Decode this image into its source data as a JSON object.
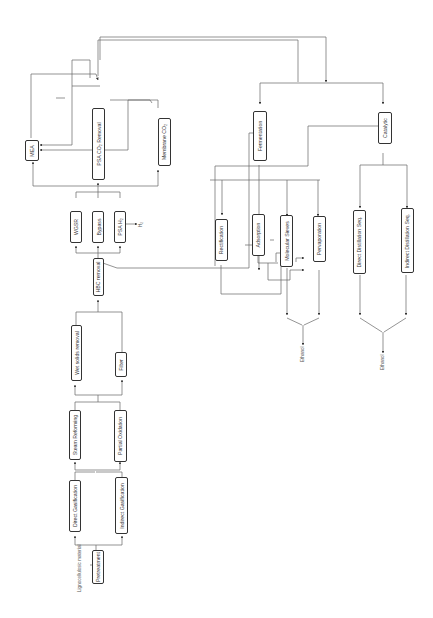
{
  "diagram": {
    "title": "",
    "orientation": "rotated-90-ccw",
    "input_label": "Lignocellulosic material",
    "nodes": {
      "pretreatment": "Pretreatment",
      "direct_gasification": "Direct Gasification",
      "indirect_gasification": "Indirect Gasification",
      "steam_reforming": "Steam Reforming",
      "partial_oxidation": "Partial Oxidation",
      "wet_solids_removal": "Wet solids removal",
      "filter": "Filter",
      "hbc_removal": "HBC removal",
      "wgsr": "WGSR",
      "bypass": "Bypass",
      "psa_h2": "PSA H₂",
      "mea": "MEA",
      "psa_co2_removal": "PSA  CO₂ Removal",
      "membrane_co2": "Membrane CO₂",
      "fermentation": "Fermentation",
      "catalytic": "Catalytic",
      "rectification": "Rectification",
      "adsorption": "Adsorption",
      "molecular_sieves": "Molecular Sieves",
      "pervaporation": "Pervaporation",
      "direct_distillation_seq": "Direct Distillation Seq.",
      "indirect_distillation_seq": "Indirect Distillation Seq."
    },
    "outputs": {
      "h2": "H₂",
      "ethanol_fermentation": "Ethanol",
      "ethanol_catalytic": "Ethanol"
    },
    "colors": {
      "line": "#555555",
      "box_border": "#333333",
      "text": "#333333",
      "background": "#ffffff"
    }
  }
}
